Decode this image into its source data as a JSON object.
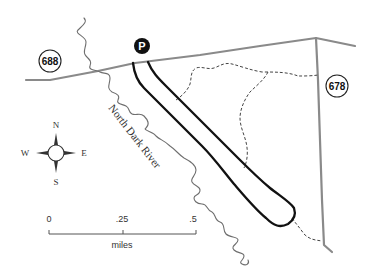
{
  "map": {
    "roads": [
      {
        "id": "688",
        "label": "688"
      },
      {
        "id": "678",
        "label": "678"
      }
    ],
    "parking": {
      "label": "P",
      "icon": "parking-icon"
    },
    "river": {
      "label": "North Dark River"
    },
    "trails": {
      "loop": "solid black loop trail",
      "side_trails": "dashed trails"
    },
    "compass": {
      "north": "N",
      "south": "S",
      "east": "E",
      "west": "W"
    },
    "scale": {
      "ticks": [
        "0",
        ".25",
        ".5"
      ],
      "unit": "miles"
    },
    "colors": {
      "road": "#8a8a8a",
      "trail": "#111111",
      "river": "#6f6f6f",
      "background": "#ffffff"
    }
  }
}
